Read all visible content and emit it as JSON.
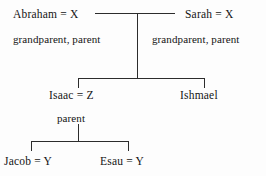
{
  "diagram": {
    "line_color": "#2c2c2c",
    "background": "#fdfdfd",
    "text_color": "#141414",
    "generations": [
      {
        "level": 1,
        "nodes": [
          {
            "id": "abraham",
            "label": "Abraham  =  X",
            "role": "grandparent, parent"
          },
          {
            "id": "sarah",
            "label": "Sarah  =  X",
            "role": "grandparent, parent"
          }
        ]
      },
      {
        "level": 2,
        "nodes": [
          {
            "id": "isaac",
            "label": "Isaac  =  Z",
            "role": "parent"
          },
          {
            "id": "ishmael",
            "label": "Ishmael",
            "role": ""
          }
        ]
      },
      {
        "level": 3,
        "nodes": [
          {
            "id": "jacob",
            "label": "Jacob  =  Y",
            "role": ""
          },
          {
            "id": "esau",
            "label": "Esau  =  Y",
            "role": ""
          }
        ]
      }
    ],
    "labels": {
      "abraham": "Abraham  =  X",
      "sarah": "Sarah  =  X",
      "isaac": "Isaac  =  Z",
      "ishmael": "Ishmael",
      "jacob": "Jacob  =  Y",
      "esau": "Esau  =  Y",
      "role_grandparent_parent_left": "grandparent, parent",
      "role_grandparent_parent_right": "grandparent, parent",
      "role_parent": "parent"
    }
  }
}
